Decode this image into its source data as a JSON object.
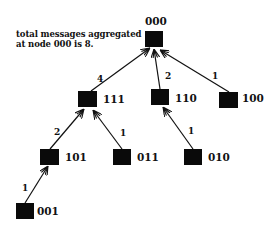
{
  "annotation": {
    "line1": "total messages aggregated",
    "line2": "at node 000 is 8."
  },
  "nodes": [
    {
      "id": "000",
      "label": "000"
    },
    {
      "id": "111",
      "label": "111"
    },
    {
      "id": "110",
      "label": "110"
    },
    {
      "id": "100",
      "label": "100"
    },
    {
      "id": "101",
      "label": "101"
    },
    {
      "id": "011",
      "label": "011"
    },
    {
      "id": "010",
      "label": "010"
    },
    {
      "id": "001",
      "label": "001"
    }
  ],
  "edges": [
    {
      "from": "111",
      "to": "000",
      "weight": "4"
    },
    {
      "from": "110",
      "to": "000",
      "weight": "2"
    },
    {
      "from": "100",
      "to": "000",
      "weight": "1"
    },
    {
      "from": "101",
      "to": "111",
      "weight": "2"
    },
    {
      "from": "011",
      "to": "111",
      "weight": "1"
    },
    {
      "from": "010",
      "to": "110",
      "weight": "1"
    },
    {
      "from": "001",
      "to": "101",
      "weight": "1"
    }
  ]
}
